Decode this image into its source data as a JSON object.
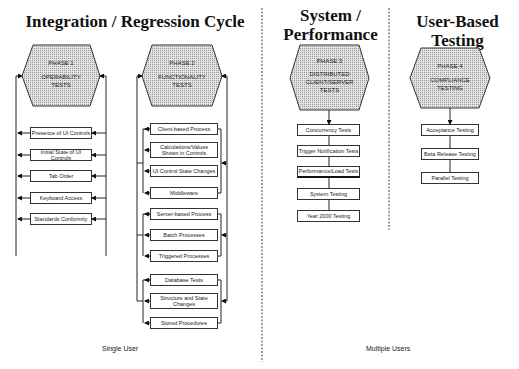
{
  "sections": {
    "integration": {
      "title": "Integration / Regression Cycle"
    },
    "system": {
      "title_line1": "System /",
      "title_line2": "Performance Cycle"
    },
    "user_based": {
      "title": "User-Based Testing"
    }
  },
  "phases": [
    {
      "phase": "PHASE 1",
      "name_line1": "OPERABILITY",
      "name_line2": "TESTS",
      "tests": [
        "Presence of UI Controls",
        "Initial State of UI Controls",
        "Tab Order",
        "Keyboard Access",
        "Standards Conformity"
      ]
    },
    {
      "phase": "PHASE 2",
      "name_line1": "FUNCTIONALITY",
      "name_line2": "TESTS",
      "groups": [
        {
          "tests": [
            "Client-based Process",
            "Calculations/Values Shown in Controls",
            "UI Control State Changes",
            "Middleware"
          ]
        },
        {
          "tests": [
            "Server-based Process",
            "Batch Processes",
            "Triggered Processes"
          ]
        },
        {
          "tests": [
            "Database Tests",
            "Structure and State Changes",
            "Stored Procedures"
          ]
        }
      ]
    },
    {
      "phase": "PHASE 3",
      "name_line1": "DISTRIBUTED",
      "name_line2": "CLIENT/SERVER",
      "name_line3": "TESTS",
      "tests": [
        "Concurrency Tests",
        "Trigger Notification Tests",
        "Performance/Load Tests",
        "System Testing",
        "Year 2000 Testing"
      ]
    },
    {
      "phase": "PHASE 4",
      "name_line1": "COMPLIANCE",
      "name_line2": "TESTING",
      "tests": [
        "Acceptance Testing",
        "Beta Release Testing",
        "Parallel Testing"
      ]
    }
  ],
  "footer": {
    "single_user": "Single User",
    "multiple_users": "Multiple Users"
  },
  "colors": {
    "hex_fill": "#d4d4d4",
    "line": "#222222"
  }
}
